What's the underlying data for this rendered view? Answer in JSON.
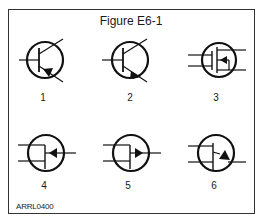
{
  "figure": {
    "title": "Figure E6-1",
    "code": "ARRL0400",
    "symbols": [
      {
        "label": "1",
        "type": "PNP bipolar junction transistor"
      },
      {
        "label": "2",
        "type": "NPN bipolar junction transistor"
      },
      {
        "label": "3",
        "type": "Dual-gate MOSFET"
      },
      {
        "label": "4",
        "type": "N-channel JFET"
      },
      {
        "label": "5",
        "type": "P-channel JFET"
      },
      {
        "label": "6",
        "type": "Unijunction transistor"
      }
    ]
  }
}
